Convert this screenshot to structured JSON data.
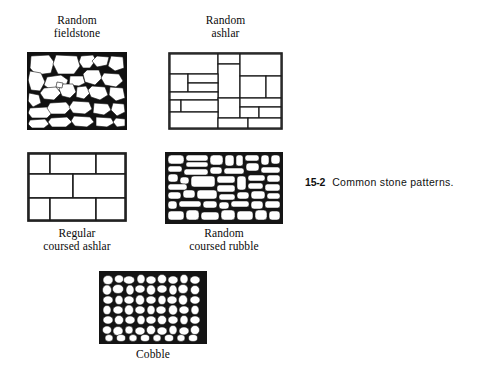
{
  "figure": {
    "caption_number": "15-2",
    "caption_text": "Common stone patterns.",
    "background_color": "#ffffff",
    "ink_color": "#000000"
  },
  "panels": [
    {
      "id": "random-fieldstone",
      "label": "Random\nfieldstone",
      "label_line1": "Random",
      "label_line2": "fieldstone",
      "label_position": "above",
      "pattern_type": "irregular-polygonal-stone",
      "x": 27,
      "y": 52,
      "width": 100,
      "height": 78,
      "description": "Irregular angular fieldstones of varying size with thick dark mortar joints"
    },
    {
      "id": "random-ashlar",
      "label": "Random\nashlar",
      "label_line1": "Random",
      "label_line2": "ashlar",
      "label_position": "above",
      "pattern_type": "rectangular-random-block",
      "x": 168,
      "y": 52,
      "width": 115,
      "height": 78,
      "description": "Rectangular cut blocks of varying sizes laid in a non-repeating pattern"
    },
    {
      "id": "regular-coursed-ashlar",
      "label": "Regular\ncoursed ashlar",
      "label_line1": "Regular",
      "label_line2": "coursed ashlar",
      "label_position": "below",
      "pattern_type": "regular-coursed-block",
      "x": 27,
      "y": 152,
      "width": 100,
      "height": 70,
      "description": "Three even horizontal courses of rectangular ashlar blocks with staggered joints"
    },
    {
      "id": "random-coursed-rubble",
      "label": "Random\ncoursed rubble",
      "label_line1": "Random",
      "label_line2": "coursed rubble",
      "label_position": "below",
      "pattern_type": "flat-rubble-courses",
      "x": 165,
      "y": 152,
      "width": 118,
      "height": 72,
      "description": "Small flat rounded rubble stones laid in rough horizontal courses"
    },
    {
      "id": "cobble",
      "label": "Cobble",
      "label_line1": "Cobble",
      "label_line2": "",
      "label_position": "below",
      "pattern_type": "rounded-cobblestone",
      "x": 99,
      "y": 271,
      "width": 108,
      "height": 73,
      "description": "Densely packed small rounded cobblestones with heavy dark mortar"
    }
  ]
}
